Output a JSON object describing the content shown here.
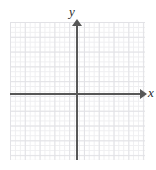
{
  "figure": {
    "name": "blank-cartesian-coordinate-plane",
    "background_color": "#ffffff",
    "width": 156,
    "height": 170
  },
  "axes": {
    "x_label": "x",
    "y_label": "y",
    "axis_color": "#575757",
    "x_axis_arrow": "right",
    "y_axis_arrow": "up",
    "tick_labels": [],
    "origin_label": ""
  },
  "grid": {
    "major_color": "#e2e2e6",
    "minor_color": "#efeff1",
    "major_spacing_px": 14.8,
    "minor_spacing_px": 4.93,
    "minor_per_major": 3
  },
  "chart_data": {
    "type": "scatter",
    "title": "",
    "subtitle": "",
    "xlabel": "x",
    "ylabel": "y",
    "xlim": [
      -9,
      9
    ],
    "ylim": [
      -9,
      9
    ],
    "xticks": [],
    "yticks": [],
    "grid": true,
    "legend": null,
    "series": [],
    "annotations": [],
    "note": "Empty coordinate grid — no plotted data points, curves, or numeric tick labels are rendered."
  }
}
